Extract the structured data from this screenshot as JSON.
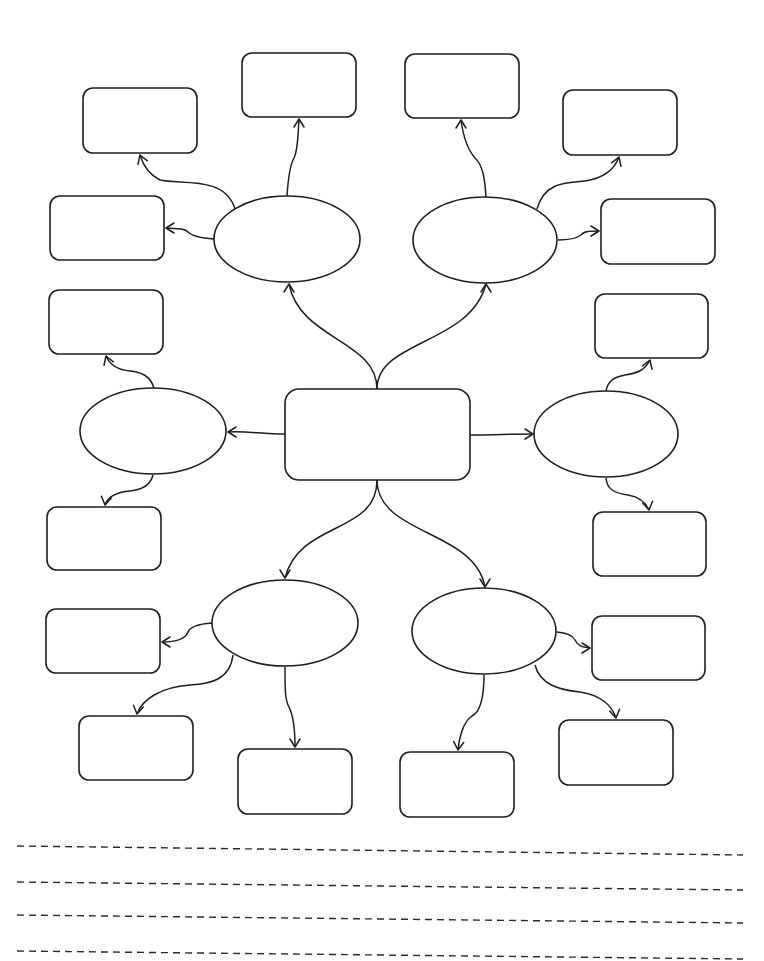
{
  "diagram": {
    "type": "mind-map worksheet",
    "stroke_color": "#1e1e1e",
    "background": "#ffffff",
    "central_topic": {
      "label": "",
      "x": 285,
      "y": 389,
      "w": 185,
      "h": 91
    },
    "subtopics": [
      {
        "id": "top-left",
        "label": "",
        "cx": 287,
        "cy": 239,
        "rx": 73,
        "ry": 43
      },
      {
        "id": "top-right",
        "label": "",
        "cx": 485,
        "cy": 240,
        "rx": 72,
        "ry": 43
      },
      {
        "id": "left",
        "label": "",
        "cx": 153,
        "cy": 431,
        "rx": 73,
        "ry": 43
      },
      {
        "id": "right",
        "label": "",
        "cx": 606,
        "cy": 434,
        "rx": 72,
        "ry": 43
      },
      {
        "id": "bottom-left",
        "label": "",
        "cx": 285,
        "cy": 623,
        "rx": 73,
        "ry": 43
      },
      {
        "id": "bottom-right",
        "label": "",
        "cx": 484,
        "cy": 631,
        "rx": 72,
        "ry": 43
      }
    ],
    "detail_boxes": [
      {
        "id": "tl-1",
        "parent": "top-left",
        "label": "",
        "x": 83,
        "y": 88,
        "w": 114,
        "h": 65
      },
      {
        "id": "tl-2",
        "parent": "top-left",
        "label": "",
        "x": 242,
        "y": 53,
        "w": 114,
        "h": 64
      },
      {
        "id": "tl-3",
        "parent": "top-left",
        "label": "",
        "x": 50,
        "y": 196,
        "w": 114,
        "h": 64
      },
      {
        "id": "tr-1",
        "parent": "top-right",
        "label": "",
        "x": 405,
        "y": 54,
        "w": 114,
        "h": 64
      },
      {
        "id": "tr-2",
        "parent": "top-right",
        "label": "",
        "x": 563,
        "y": 90,
        "w": 114,
        "h": 65
      },
      {
        "id": "tr-3",
        "parent": "top-right",
        "label": "",
        "x": 601,
        "y": 199,
        "w": 114,
        "h": 65
      },
      {
        "id": "l-1",
        "parent": "left",
        "label": "",
        "x": 49,
        "y": 290,
        "w": 114,
        "h": 64
      },
      {
        "id": "l-2",
        "parent": "left",
        "label": "",
        "x": 47,
        "y": 507,
        "w": 114,
        "h": 63
      },
      {
        "id": "r-1",
        "parent": "right",
        "label": "",
        "x": 595,
        "y": 294,
        "w": 113,
        "h": 64
      },
      {
        "id": "r-2",
        "parent": "right",
        "label": "",
        "x": 593,
        "y": 512,
        "w": 113,
        "h": 64
      },
      {
        "id": "bl-1",
        "parent": "bottom-left",
        "label": "",
        "x": 46,
        "y": 609,
        "w": 114,
        "h": 64
      },
      {
        "id": "bl-2",
        "parent": "bottom-left",
        "label": "",
        "x": 79,
        "y": 716,
        "w": 114,
        "h": 64
      },
      {
        "id": "bl-3",
        "parent": "bottom-left",
        "label": "",
        "x": 238,
        "y": 749,
        "w": 114,
        "h": 65
      },
      {
        "id": "br-1",
        "parent": "bottom-right",
        "label": "",
        "x": 592,
        "y": 616,
        "w": 113,
        "h": 64
      },
      {
        "id": "br-2",
        "parent": "bottom-right",
        "label": "",
        "x": 559,
        "y": 720,
        "w": 114,
        "h": 65
      },
      {
        "id": "br-3",
        "parent": "bottom-right",
        "label": "",
        "x": 400,
        "y": 752,
        "w": 114,
        "h": 65
      }
    ],
    "connectors": [
      {
        "id": "c-center-tl",
        "from": "central",
        "to": "top-left",
        "d": "M377,389 C377,340 300,340 289,284",
        "arrow": [
          289,
          284,
          -90
        ]
      },
      {
        "id": "c-center-tr",
        "from": "central",
        "to": "top-right",
        "d": "M377,389 C377,340 470,345 486,284",
        "arrow": [
          486,
          284,
          -90
        ]
      },
      {
        "id": "c-center-l",
        "from": "central",
        "to": "left",
        "d": "M285,434 C260,434 250,431 228,432",
        "arrow": [
          228,
          432,
          180
        ]
      },
      {
        "id": "c-center-r",
        "from": "central",
        "to": "right",
        "d": "M470,435 C495,435 510,434 533,434",
        "arrow": [
          533,
          434,
          0
        ]
      },
      {
        "id": "c-center-bl",
        "from": "central",
        "to": "bottom-left",
        "d": "M377,480 C377,535 300,520 285,578",
        "arrow": [
          285,
          578,
          90
        ]
      },
      {
        "id": "c-center-br",
        "from": "central",
        "to": "bottom-right",
        "d": "M377,480 C377,535 475,530 485,587",
        "arrow": [
          485,
          587,
          90
        ]
      },
      {
        "id": "c-tl-1",
        "from": "top-left",
        "to": "tl-1",
        "d": "M235,209 C225,175 180,185 160,180 C150,175 143,165 140,155",
        "arrow": [
          140,
          155,
          -110
        ]
      },
      {
        "id": "c-tl-2",
        "from": "top-left",
        "to": "tl-2",
        "d": "M287,196 C288,180 290,165 294,158 C298,150 298,135 299,119",
        "arrow": [
          299,
          119,
          -90
        ]
      },
      {
        "id": "c-tl-3",
        "from": "top-left",
        "to": "tl-3",
        "d": "M214,239 C200,238 192,236 188,232 C184,228 178,229 166,228",
        "arrow": [
          166,
          228,
          180
        ]
      },
      {
        "id": "c-tr-1",
        "from": "top-right",
        "to": "tr-1",
        "d": "M486,197 C485,180 483,165 475,158 C468,150 463,135 461,120",
        "arrow": [
          461,
          120,
          -90
        ]
      },
      {
        "id": "c-tr-2",
        "from": "top-right",
        "to": "tr-2",
        "d": "M537,209 C545,180 570,183 585,181 C605,178 615,168 619,157",
        "arrow": [
          619,
          157,
          -70
        ]
      },
      {
        "id": "c-tr-3",
        "from": "top-right",
        "to": "tr-3",
        "d": "M558,240 C570,240 577,238 581,235 C584,231 590,231 599,231",
        "arrow": [
          599,
          231,
          0
        ]
      },
      {
        "id": "c-l-1",
        "from": "left",
        "to": "l-1",
        "d": "M154,388 C150,375 140,372 130,371 C118,370 110,365 106,356",
        "arrow": [
          106,
          356,
          -110
        ]
      },
      {
        "id": "c-l-2",
        "from": "left",
        "to": "l-2",
        "d": "M153,475 C150,487 140,490 130,491 C118,492 108,496 105,505",
        "arrow": [
          105,
          505,
          100
        ]
      },
      {
        "id": "c-r-1",
        "from": "right",
        "to": "r-1",
        "d": "M606,391 C608,380 615,377 625,375 C638,373 645,370 650,360",
        "arrow": [
          650,
          360,
          -70
        ]
      },
      {
        "id": "c-r-2",
        "from": "right",
        "to": "r-2",
        "d": "M606,478 C607,490 615,493 628,495 C640,497 646,503 649,510",
        "arrow": [
          649,
          510,
          80
        ]
      },
      {
        "id": "c-bl-1",
        "from": "bottom-left",
        "to": "bl-1",
        "d": "M212,623 C198,624 190,627 188,632 C185,640 175,642 162,642",
        "arrow": [
          162,
          642,
          180
        ]
      },
      {
        "id": "c-bl-2",
        "from": "bottom-left",
        "to": "bl-2",
        "d": "M233,655 C230,680 210,684 190,685 C160,687 142,700 137,714",
        "arrow": [
          137,
          714,
          100
        ]
      },
      {
        "id": "c-bl-3",
        "from": "bottom-left",
        "to": "bl-3",
        "d": "M285,667 C285,690 285,700 289,707 C293,715 295,730 295,747",
        "arrow": [
          295,
          747,
          90
        ]
      },
      {
        "id": "c-br-1",
        "from": "bottom-right",
        "to": "br-1",
        "d": "M557,632 C568,633 573,636 575,640 C578,646 582,647 590,648",
        "arrow": [
          590,
          648,
          0
        ]
      },
      {
        "id": "c-br-2",
        "from": "bottom-right",
        "to": "br-2",
        "d": "M535,665 C540,685 560,690 580,692 C600,695 612,705 616,718",
        "arrow": [
          616,
          718,
          80
        ]
      },
      {
        "id": "c-br-3",
        "from": "bottom-right",
        "to": "br-3",
        "d": "M484,675 C484,700 480,712 472,716 C463,722 459,738 458,750",
        "arrow": [
          458,
          750,
          95
        ]
      }
    ],
    "writing_lines": [
      {
        "y1": 846,
        "y2": 855,
        "x1": 17,
        "x2": 743
      },
      {
        "y1": 882,
        "y2": 890,
        "x1": 17,
        "x2": 743
      },
      {
        "y1": 915,
        "y2": 923,
        "x1": 17,
        "x2": 743
      },
      {
        "y1": 951,
        "y2": 959,
        "x1": 17,
        "x2": 743
      }
    ]
  }
}
